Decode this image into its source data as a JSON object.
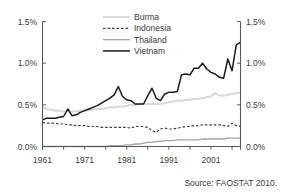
{
  "chart_data": {
    "type": "line",
    "title": "",
    "xlabel": "",
    "ylabel": "",
    "xlim": [
      1961,
      2008
    ],
    "ylim": [
      0.0,
      1.5
    ],
    "ytick_labels": [
      "0.0%",
      "0.5%",
      "1.0%",
      "1.5%"
    ],
    "ytick_values": [
      0.0,
      0.5,
      1.0,
      1.5
    ],
    "xtick_labels": [
      "1961",
      "1971",
      "1981",
      "1991",
      "2001"
    ],
    "xtick_values": [
      1961,
      1971,
      1981,
      1991,
      2001
    ],
    "minor_xtick_values": [
      1961,
      1966,
      1971,
      1976,
      1981,
      1986,
      1991,
      1996,
      2001,
      2006
    ],
    "grid": false,
    "legend_position": "top-center",
    "dual_y_axis": true,
    "units": "percent",
    "x": [
      1961,
      1962,
      1963,
      1964,
      1965,
      1966,
      1967,
      1968,
      1969,
      1970,
      1971,
      1972,
      1973,
      1974,
      1975,
      1976,
      1977,
      1978,
      1979,
      1980,
      1981,
      1982,
      1983,
      1984,
      1985,
      1986,
      1987,
      1988,
      1989,
      1990,
      1991,
      1992,
      1993,
      1994,
      1995,
      1996,
      1997,
      1998,
      1999,
      2000,
      2001,
      2002,
      2003,
      2004,
      2005,
      2006,
      2007,
      2008
    ],
    "series": [
      {
        "name": "Burma",
        "color": "#d9d9d9",
        "style": "solid",
        "width": 2.1,
        "values": [
          0.47,
          0.45,
          0.44,
          0.43,
          0.43,
          0.42,
          0.42,
          0.42,
          0.42,
          0.43,
          0.43,
          0.44,
          0.44,
          0.45,
          0.45,
          0.46,
          0.47,
          0.47,
          0.48,
          0.48,
          0.49,
          0.5,
          0.5,
          0.51,
          0.51,
          0.51,
          0.51,
          0.51,
          0.51,
          0.52,
          0.53,
          0.54,
          0.55,
          0.55,
          0.56,
          0.56,
          0.57,
          0.57,
          0.58,
          0.59,
          0.6,
          0.64,
          0.61,
          0.61,
          0.62,
          0.63,
          0.64,
          0.65
        ]
      },
      {
        "name": "Indonesia",
        "color": "#404040",
        "style": "dashed",
        "width": 1.2,
        "values": [
          0.29,
          0.28,
          0.28,
          0.28,
          0.27,
          0.27,
          0.26,
          0.26,
          0.25,
          0.25,
          0.25,
          0.24,
          0.24,
          0.24,
          0.23,
          0.23,
          0.23,
          0.23,
          0.23,
          0.23,
          0.23,
          0.22,
          0.24,
          0.24,
          0.24,
          0.23,
          0.19,
          0.17,
          0.21,
          0.22,
          0.21,
          0.21,
          0.22,
          0.23,
          0.24,
          0.24,
          0.25,
          0.25,
          0.26,
          0.26,
          0.26,
          0.26,
          0.26,
          0.25,
          0.24,
          0.28,
          0.25,
          0.24
        ]
      },
      {
        "name": "Thailand",
        "color": "#a6a6a6",
        "style": "solid",
        "width": 1.3,
        "values": [
          0.0,
          0.0,
          0.0,
          0.0,
          0.0,
          0.0,
          0.0,
          0.0,
          0.0,
          0.0,
          0.0,
          0.0,
          0.0,
          0.0,
          0.0,
          0.0,
          0.01,
          0.01,
          0.01,
          0.01,
          0.02,
          0.02,
          0.03,
          0.03,
          0.04,
          0.05,
          0.05,
          0.06,
          0.06,
          0.07,
          0.07,
          0.07,
          0.08,
          0.08,
          0.08,
          0.08,
          0.08,
          0.08,
          0.09,
          0.09,
          0.09,
          0.09,
          0.09,
          0.09,
          0.1,
          0.1,
          0.1,
          0.1
        ]
      },
      {
        "name": "Vietnam",
        "color": "#1a1a1a",
        "style": "solid",
        "width": 1.5,
        "values": [
          0.32,
          0.34,
          0.34,
          0.34,
          0.35,
          0.36,
          0.45,
          0.37,
          0.38,
          0.41,
          0.43,
          0.45,
          0.47,
          0.49,
          0.52,
          0.55,
          0.58,
          0.62,
          0.72,
          0.6,
          0.56,
          0.55,
          0.51,
          0.51,
          0.51,
          0.61,
          0.7,
          0.58,
          0.55,
          0.63,
          0.65,
          0.65,
          0.66,
          0.86,
          0.87,
          0.86,
          0.94,
          0.94,
          1.0,
          0.93,
          0.89,
          0.87,
          0.83,
          0.82,
          1.05,
          0.91,
          1.22,
          1.25
        ]
      }
    ]
  },
  "legend": {
    "items": [
      {
        "label": "Burma"
      },
      {
        "label": "Indonesia"
      },
      {
        "label": "Thailand"
      },
      {
        "label": "Vietnam"
      }
    ]
  },
  "source": {
    "text": "Source: FAOSTAT 2010."
  }
}
